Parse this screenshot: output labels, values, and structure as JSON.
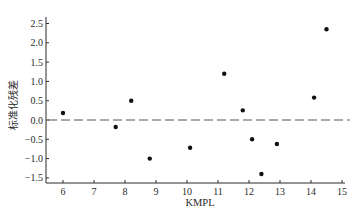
{
  "chart_data": {
    "type": "scatter",
    "title": "",
    "xlabel": "KMPL",
    "ylabel": "标准化残差",
    "xlim": [
      5.5,
      15.1
    ],
    "ylim": [
      -1.65,
      2.65
    ],
    "xticks": [
      6,
      7,
      8,
      9,
      10,
      11,
      12,
      13,
      14,
      15
    ],
    "yticks": [
      2.5,
      2.0,
      1.5,
      1.0,
      0.5,
      0.0,
      -0.5,
      -1.0,
      -1.5
    ],
    "ytick_labels": [
      "2.5",
      "2.0",
      "1.5",
      "1.0",
      "0.5",
      "0.0",
      "−0.5",
      "−1.0",
      "−1.5"
    ],
    "grid": false,
    "legend": null,
    "reference_line": {
      "y": 0.0,
      "style": "dashed"
    },
    "series": [
      {
        "name": "standardized residuals",
        "points": [
          {
            "x": 6.0,
            "y": 0.18
          },
          {
            "x": 7.7,
            "y": -0.18
          },
          {
            "x": 8.2,
            "y": 0.5
          },
          {
            "x": 8.8,
            "y": -1.0
          },
          {
            "x": 10.1,
            "y": -0.72
          },
          {
            "x": 11.2,
            "y": 1.2
          },
          {
            "x": 11.8,
            "y": 0.25
          },
          {
            "x": 12.1,
            "y": -0.5
          },
          {
            "x": 12.4,
            "y": -1.4
          },
          {
            "x": 12.9,
            "y": -0.62
          },
          {
            "x": 14.1,
            "y": 0.58
          },
          {
            "x": 14.5,
            "y": 2.35
          }
        ]
      }
    ]
  },
  "colors": {
    "axis": "#2a2a2a",
    "points": "#111111",
    "reference_line": "#555555"
  }
}
